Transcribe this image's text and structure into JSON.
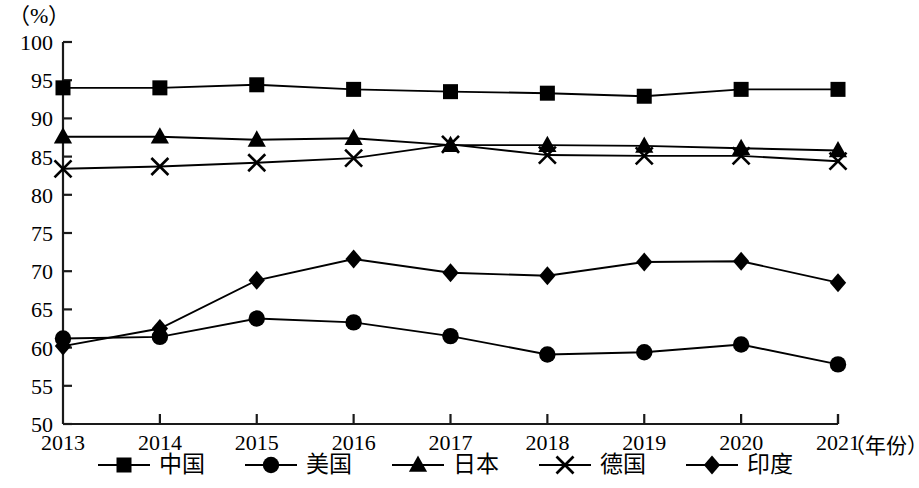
{
  "axis": {
    "unit_label": "（%）",
    "x_title": "（年份）",
    "y_ticks": [
      "100",
      "95",
      "90",
      "85",
      "80",
      "75",
      "70",
      "65",
      "60",
      "55",
      "50"
    ],
    "x_ticks": [
      "2013",
      "2014",
      "2015",
      "2016",
      "2017",
      "2018",
      "2019",
      "2020",
      "2021"
    ]
  },
  "legend": {
    "items": [
      {
        "label": "中国",
        "marker": "square-marker",
        "color": "#000000"
      },
      {
        "label": "美国",
        "marker": "circle-marker",
        "color": "#000000"
      },
      {
        "label": "日本",
        "marker": "triangle-marker",
        "color": "#000000"
      },
      {
        "label": "德国",
        "marker": "x-marker",
        "color": "#000000"
      },
      {
        "label": "印度",
        "marker": "diamond-marker",
        "color": "#000000"
      }
    ]
  },
  "chart_data": {
    "type": "line",
    "title": "",
    "subtitle": "",
    "xlabel": "（年份）",
    "ylabel": "（%）",
    "xlim": [
      2013,
      2021
    ],
    "ylim": [
      50,
      100
    ],
    "ytick_step": 5,
    "grid": false,
    "legend_position": "bottom",
    "categories": [
      "2013",
      "2014",
      "2015",
      "2016",
      "2017",
      "2018",
      "2019",
      "2020",
      "2021"
    ],
    "x": [
      2013,
      2014,
      2015,
      2016,
      2017,
      2018,
      2019,
      2020,
      2021
    ],
    "series": [
      {
        "name": "中国",
        "marker": "square",
        "values": [
          94.0,
          94.0,
          94.4,
          93.8,
          93.5,
          93.3,
          92.9,
          93.8,
          93.8
        ]
      },
      {
        "name": "美国",
        "marker": "circle",
        "values": [
          61.2,
          61.4,
          63.8,
          63.3,
          61.5,
          59.1,
          59.4,
          60.4,
          57.8
        ]
      },
      {
        "name": "日本",
        "marker": "triangle",
        "values": [
          87.6,
          87.6,
          87.2,
          87.4,
          86.5,
          86.5,
          86.4,
          86.1,
          85.8
        ]
      },
      {
        "name": "德国",
        "marker": "x",
        "values": [
          83.4,
          83.7,
          84.2,
          84.8,
          86.6,
          85.2,
          85.1,
          85.1,
          84.4
        ]
      },
      {
        "name": "印度",
        "marker": "diamond",
        "values": [
          60.2,
          62.5,
          68.8,
          71.6,
          69.8,
          69.4,
          71.2,
          71.3,
          68.5
        ]
      }
    ]
  }
}
